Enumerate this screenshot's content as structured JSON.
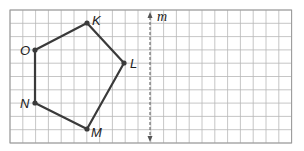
{
  "diagram": {
    "type": "geometry-reflection-grid",
    "grid": {
      "x0": 10,
      "y0": 10,
      "cols": 22,
      "rows": 10,
      "cell_w": 12.8,
      "cell_h": 13.3,
      "line_color": "#b8b8b8",
      "border_color": "#999999"
    },
    "polygon": {
      "stroke": "#3a3a3a",
      "vertices": [
        {
          "label": "K",
          "x": 87,
          "y": 23,
          "lx": 92,
          "ly": 25
        },
        {
          "label": "L",
          "x": 124,
          "y": 63,
          "lx": 130,
          "ly": 68
        },
        {
          "label": "M",
          "x": 87,
          "y": 129,
          "lx": 91,
          "ly": 137
        },
        {
          "label": "N",
          "x": 35,
          "y": 103,
          "lx": 20,
          "ly": 108
        },
        {
          "label": "O",
          "x": 35,
          "y": 50,
          "lx": 20,
          "ly": 55
        }
      ]
    },
    "line_of_reflection": {
      "label": "m",
      "x": 150,
      "y_top": 12,
      "y_bottom": 142,
      "color": "#555555"
    }
  }
}
